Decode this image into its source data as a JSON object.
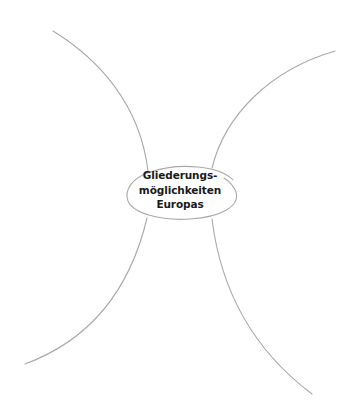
{
  "diagram": {
    "type": "mind-map",
    "center_node": {
      "lines": [
        "Gliederungs-",
        "möglichkeiten",
        "Europas"
      ],
      "text": "Gliederungsmöglichkeiten Europas"
    },
    "branches": [
      {
        "position": "top-left",
        "label": ""
      },
      {
        "position": "top-right",
        "label": ""
      },
      {
        "position": "bottom-left",
        "label": ""
      },
      {
        "position": "bottom-right",
        "label": ""
      }
    ],
    "colors": {
      "line": "#a9a9a9",
      "text": "#1a1a1a",
      "background": "#ffffff"
    }
  }
}
